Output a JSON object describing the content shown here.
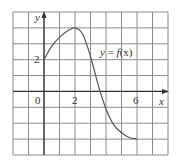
{
  "chart_data": {
    "type": "line",
    "title": "",
    "xlabel": "x",
    "ylabel": "y",
    "curve_label": "y = f(x)",
    "xlim": [
      -2,
      8
    ],
    "ylim": [
      -4,
      5
    ],
    "grid": true,
    "grid_step": 1,
    "x_tick_labels": [
      {
        "value": 0,
        "label": "0"
      },
      {
        "value": 2,
        "label": "2"
      },
      {
        "value": 6,
        "label": "6"
      }
    ],
    "y_tick_labels": [
      {
        "value": 2,
        "label": "2"
      }
    ],
    "series": [
      {
        "name": "f(x)",
        "x": [
          0,
          0.5,
          1,
          1.5,
          2,
          2.5,
          3,
          3.5,
          4,
          4.5,
          5,
          5.5,
          6
        ],
        "y": [
          2,
          2.85,
          3.4,
          3.8,
          4,
          3.6,
          2.2,
          0.4,
          -1.1,
          -2.1,
          -2.6,
          -2.9,
          -3
        ]
      }
    ],
    "annotations": [
      {
        "text": "y = f(x)",
        "x": 4.9,
        "y": 2.4
      }
    ],
    "colors": {
      "grid": "#8c8c8c",
      "axis": "#333333",
      "curve": "#555555"
    }
  },
  "labels": {
    "y_axis": "y",
    "x_axis": "x",
    "origin": "0",
    "x_tick_2": "2",
    "x_tick_6": "6",
    "y_tick_2": "2",
    "curve_eq_y": "y",
    "curve_eq_eq": " = ",
    "curve_eq_f": "f",
    "curve_eq_arg": "(x)"
  }
}
